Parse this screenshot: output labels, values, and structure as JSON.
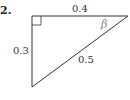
{
  "problem": {
    "number": "2."
  },
  "triangle": {
    "vertices": {
      "top_left": [
        32,
        16
      ],
      "top_right": [
        128,
        16
      ],
      "bottom": [
        32,
        87
      ]
    },
    "right_angle_at": "top_left",
    "sides": {
      "top": "0.4",
      "left": "0.3",
      "hypotenuse": "0.5"
    },
    "angle_label": "β",
    "stroke_color": "#333333"
  }
}
